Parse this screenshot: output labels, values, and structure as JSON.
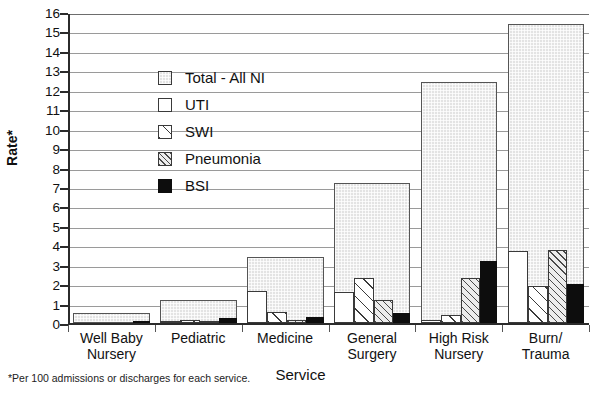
{
  "chart_data": {
    "type": "bar",
    "title": "",
    "xlabel": "Service",
    "ylabel": "Rate*",
    "ylim": [
      0,
      16
    ],
    "ystep": 1,
    "grid": true,
    "legend_position": "inside-upper-left",
    "categories": [
      "Well Baby\nNursery",
      "Pediatric",
      "Medicine",
      "General\nSurgery",
      "High Risk\nNursery",
      "Burn/\nTrauma"
    ],
    "category_lines": [
      [
        "Well Baby",
        "Nursery"
      ],
      [
        "Pediatric",
        ""
      ],
      [
        "Medicine",
        ""
      ],
      [
        "General",
        "Surgery"
      ],
      [
        "High Risk",
        "Nursery"
      ],
      [
        "Burn/",
        "Trauma"
      ]
    ],
    "series": [
      {
        "name": "Total - All NI",
        "key": "total",
        "values": [
          0.5,
          1.2,
          3.4,
          7.2,
          12.4,
          15.4
        ]
      },
      {
        "name": "UTI",
        "key": "uti",
        "values": [
          0.0,
          0.1,
          1.65,
          1.6,
          0.15,
          3.7
        ]
      },
      {
        "name": "SWI",
        "key": "swi",
        "values": [
          0.0,
          0.15,
          0.55,
          2.3,
          0.4,
          1.9
        ]
      },
      {
        "name": "Pneumonia",
        "key": "pneu",
        "values": [
          0.0,
          0.1,
          0.15,
          1.2,
          2.3,
          3.75
        ]
      },
      {
        "name": "BSI",
        "key": "bsi",
        "values": [
          0.12,
          0.25,
          0.3,
          0.5,
          3.2,
          2.0
        ]
      }
    ],
    "yticks": [
      "0",
      "1",
      "2",
      "3",
      "4",
      "5",
      "6",
      "7",
      "8",
      "9",
      "10",
      "11",
      "12",
      "13",
      "14",
      "15",
      "16"
    ],
    "footnote": "*Per 100 admissions or discharges for each service."
  },
  "legend": {
    "items": [
      {
        "label": "Total - All NI",
        "swatch": "swatch-dotted-grid"
      },
      {
        "label": "UTI",
        "swatch": "swatch-white"
      },
      {
        "label": "SWI",
        "swatch": "swatch-diagonal-sparse"
      },
      {
        "label": "Pneumonia",
        "swatch": "swatch-diagonal-dense"
      },
      {
        "label": "BSI",
        "swatch": "swatch-solid-black"
      }
    ]
  },
  "colors": {
    "axis": "#2b2b2b",
    "gridline": "#9a9a9a",
    "bsi_fill": "#0d0d0d",
    "total_fill": "#e3e3e3",
    "background": "#ffffff"
  }
}
